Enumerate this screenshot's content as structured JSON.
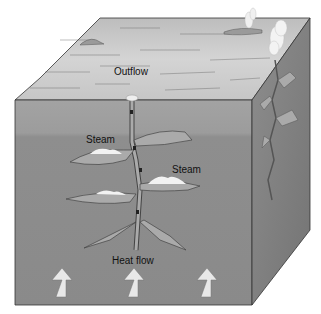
{
  "figure": {
    "type": "block-diagram",
    "labels": {
      "outflow": "Outflow",
      "steam_upper": "Steam",
      "steam_right": "Steam",
      "heat_flow": "Heat flow"
    },
    "heat_arrows": 3,
    "colors": {
      "top_face": "#c9c9c9",
      "front_upper": "#9a9a9a",
      "front_lower": "#8a8a8a",
      "right_face": "#7d7d7d",
      "fracture_fill": "#aaaaaa",
      "steam": "#f2f2f2",
      "arrow": "#e6e6e6",
      "outline": "#333333"
    }
  }
}
